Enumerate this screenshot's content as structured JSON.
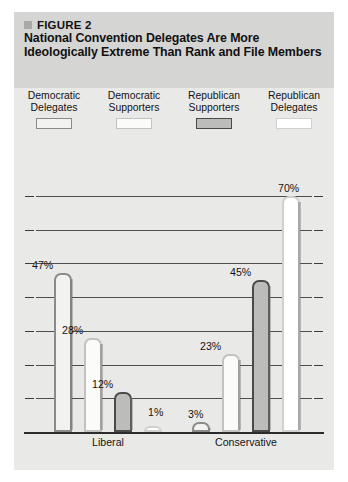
{
  "figure": {
    "number_label": "FIGURE 2",
    "title": "National Convention Delegates Are More Ideologically Extreme Than Rank and File Members",
    "marker_icon": "square-bullet-icon"
  },
  "legend": {
    "position": "top",
    "entries": [
      {
        "line1": "Democratic",
        "line2": "Delegates",
        "swatch_color": "#f2f2f0",
        "swatch_border": "#8a8a88"
      },
      {
        "line1": "Democratic",
        "line2": "Supporters",
        "swatch_color": "#fbfbfa",
        "swatch_border": "#c2c2c0"
      },
      {
        "line1": "Republican",
        "line2": "Supporters",
        "swatch_color": "#bcbcba",
        "swatch_border": "#4a4a48"
      },
      {
        "line1": "Republican",
        "line2": "Delegates",
        "swatch_color": "#ffffff",
        "swatch_border": "#d0d0ce"
      }
    ]
  },
  "chart_data": {
    "type": "bar",
    "title": "National Convention Delegates Are More Ideologically Extreme Than Rank and File Members",
    "xlabel": "",
    "ylabel": "",
    "ylim": [
      0,
      80
    ],
    "grid": true,
    "gridlines": [
      10,
      20,
      30,
      40,
      50,
      60,
      70
    ],
    "legend_position": "top",
    "categories": [
      "Liberal",
      "Conservative"
    ],
    "series": [
      {
        "name": "Democratic Delegates",
        "values": [
          47,
          3
        ],
        "labels": [
          "47%",
          "3%"
        ],
        "fill": "#f2f2f0",
        "border": "#8a8a88"
      },
      {
        "name": "Democratic Supporters",
        "values": [
          28,
          23
        ],
        "labels": [
          "28%",
          "23%"
        ],
        "fill": "#fbfbfa",
        "border": "#c2c2c0"
      },
      {
        "name": "Republican Supporters",
        "values": [
          12,
          45
        ],
        "labels": [
          "12%",
          "45%"
        ],
        "fill": "#bcbcba",
        "border": "#4a4a48"
      },
      {
        "name": "Republican Delegates",
        "values": [
          1,
          70
        ],
        "labels": [
          "1%",
          "70%"
        ],
        "fill": "#ffffff",
        "border": "#d0d0ce"
      }
    ],
    "bars": [
      {
        "group": "Liberal",
        "series": "Democratic Delegates",
        "value": 47,
        "label": "47%"
      },
      {
        "group": "Liberal",
        "series": "Democratic Supporters",
        "value": 28,
        "label": "28%"
      },
      {
        "group": "Liberal",
        "series": "Republican Supporters",
        "value": 12,
        "label": "12%"
      },
      {
        "group": "Liberal",
        "series": "Republican Delegates",
        "value": 1,
        "label": "1%"
      },
      {
        "group": "Conservative",
        "series": "Democratic Delegates",
        "value": 3,
        "label": "3%"
      },
      {
        "group": "Conservative",
        "series": "Democratic Supporters",
        "value": 23,
        "label": "23%"
      },
      {
        "group": "Conservative",
        "series": "Republican Supporters",
        "value": 45,
        "label": "45%"
      },
      {
        "group": "Conservative",
        "series": "Republican Delegates",
        "value": 70,
        "label": "70%"
      }
    ]
  }
}
